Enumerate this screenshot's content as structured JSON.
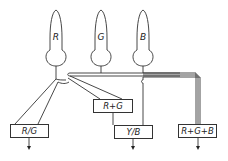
{
  "diagram": {
    "receptors": [
      {
        "label": "R"
      },
      {
        "label": "G"
      },
      {
        "label": "B"
      }
    ],
    "channels": [
      {
        "label": "R/G"
      },
      {
        "label": "R+G"
      },
      {
        "label": "Y/B"
      },
      {
        "label": "R+G+B"
      }
    ],
    "colors": {
      "line": "#333333",
      "background": "#ffffff"
    }
  }
}
